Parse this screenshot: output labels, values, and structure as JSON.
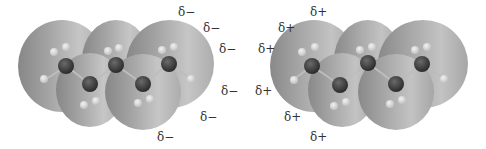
{
  "figure": {
    "panels": [
      {
        "id": "left",
        "charge_label": "δ−",
        "labels": [
          {
            "text": "δ−",
            "x": 178,
            "y": 6
          },
          {
            "text": "δ−",
            "x": 203,
            "y": 22
          },
          {
            "text": "δ−",
            "x": 219,
            "y": 43
          },
          {
            "text": "δ−",
            "x": 221,
            "y": 85
          },
          {
            "text": "δ−",
            "x": 200,
            "y": 111
          },
          {
            "text": "δ−",
            "x": 157,
            "y": 131
          }
        ],
        "offset_x": 0,
        "surface_gradient": [
          "#8a8a8a",
          "#a3a3a3",
          "#c4c4c4",
          "#b4b4b4"
        ],
        "carbons": [
          [
            66,
            66
          ],
          [
            90,
            84
          ],
          [
            116,
            65
          ],
          [
            143,
            84
          ],
          [
            169,
            64
          ]
        ]
      },
      {
        "id": "right",
        "charge_label": "δ+",
        "labels": [
          {
            "text": "δ+",
            "x": 310,
            "y": 6
          },
          {
            "text": "δ+",
            "x": 278,
            "y": 22
          },
          {
            "text": "δ+",
            "x": 258,
            "y": 43
          },
          {
            "text": "δ+",
            "x": 255,
            "y": 85
          },
          {
            "text": "δ+",
            "x": 284,
            "y": 111
          },
          {
            "text": "δ+",
            "x": 310,
            "y": 131
          }
        ],
        "offset_x": 252,
        "surface_gradient": [
          "#8c8c8c",
          "#a8a8a8",
          "#c2c2c2",
          "#ababab"
        ],
        "carbons": [
          [
            312,
            66
          ],
          [
            340,
            85
          ],
          [
            368,
            63
          ],
          [
            396,
            84
          ],
          [
            422,
            64
          ]
        ]
      }
    ]
  },
  "colors": {
    "background": "#ffffff",
    "carbon": "#3a3a3a",
    "hydrogen": "#d9d9d9",
    "bond": "#bdbdbd",
    "label": "#333333"
  }
}
